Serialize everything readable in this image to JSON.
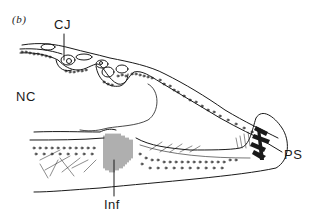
{
  "figure": {
    "panel_label": "(b)",
    "labels": {
      "cj": "CJ",
      "nc": "NC",
      "inf": "Inf",
      "ps": "PS"
    },
    "colors": {
      "ink": "#1a1a1a",
      "background": "#ffffff"
    }
  }
}
